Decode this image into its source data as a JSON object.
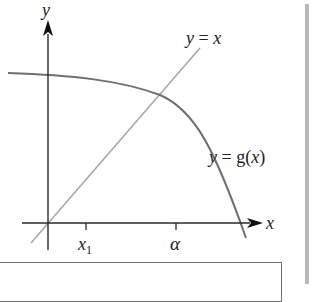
{
  "figure": {
    "axes": {
      "x_label": "x",
      "y_label": "y"
    },
    "curves": {
      "identity_line": {
        "label": "y = x",
        "label_prefix": "y",
        "label_eq": " = ",
        "label_var": "x",
        "color": "#a9a9a9"
      },
      "g_curve": {
        "label": "y = g(x)",
        "label_prefix": "y",
        "label_eq": " = g(",
        "label_var": "x",
        "label_close": ")",
        "color": "#6f6f6f"
      }
    },
    "ticks": [
      {
        "label": "x",
        "subscript": "1",
        "name": "x1"
      },
      {
        "label": "α",
        "name": "alpha"
      }
    ],
    "colors": {
      "axis": "#2a2a2a",
      "identity_line": "#a9a9a9",
      "g_curve": "#6f6f6f",
      "sidebar_rule": "#b9b9b9",
      "box_border": "#6e6e6e"
    }
  }
}
